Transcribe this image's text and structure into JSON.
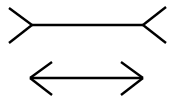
{
  "diagram": {
    "background": "#ffffff",
    "stroke_color": "#000000",
    "stroke_width": 2.4,
    "figures": [
      {
        "name": "top-line-fins-out",
        "shaft": {
          "x1": 32,
          "y1": 25,
          "x2": 143,
          "y2": 25
        },
        "left_fins": [
          {
            "x1": 9,
            "y1": 8,
            "x2": 32,
            "y2": 25
          },
          {
            "x1": 32,
            "y1": 25,
            "x2": 9,
            "y2": 43
          }
        ],
        "right_fins": [
          {
            "x1": 143,
            "y1": 25,
            "x2": 166,
            "y2": 7
          },
          {
            "x1": 143,
            "y1": 25,
            "x2": 166,
            "y2": 43
          }
        ]
      },
      {
        "name": "bottom-line-fins-in",
        "shaft": {
          "x1": 30,
          "y1": 78,
          "x2": 143,
          "y2": 78
        },
        "left_fins": [
          {
            "x1": 52,
            "y1": 62,
            "x2": 30,
            "y2": 78
          },
          {
            "x1": 30,
            "y1": 78,
            "x2": 52,
            "y2": 95
          }
        ],
        "right_fins": [
          {
            "x1": 121,
            "y1": 62,
            "x2": 143,
            "y2": 78
          },
          {
            "x1": 143,
            "y1": 78,
            "x2": 121,
            "y2": 95
          }
        ]
      }
    ]
  }
}
